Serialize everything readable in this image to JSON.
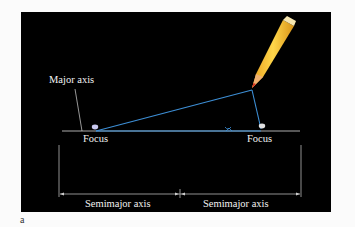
{
  "diagram": {
    "labels": {
      "major_axis": "Major axis",
      "focus_left": "Focus",
      "focus_right": "Focus",
      "semimajor_left": "Semimajor axis",
      "semimajor_right": "Semimajor axis"
    },
    "figure_label": "a",
    "colors": {
      "background": "#000000",
      "string": "#3d8fd6",
      "axis_line": "#dcdcdc",
      "pencil": "#f2c23a"
    }
  }
}
